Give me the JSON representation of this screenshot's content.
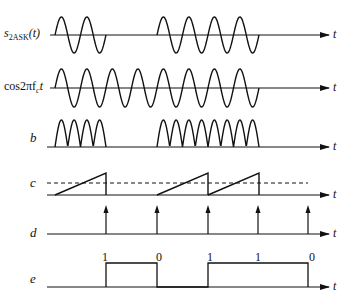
{
  "diagram": {
    "rows": [
      {
        "id": "s2ask",
        "label_main": "s",
        "label_sub": "2ASK",
        "label_tail": "(t)",
        "axis_y": 35,
        "axis_label": "t"
      },
      {
        "id": "carrier",
        "label_main": "cos2πf",
        "label_sub": "c",
        "label_tail": "t",
        "axis_y": 88,
        "axis_label": "t"
      },
      {
        "id": "b",
        "label_main": "b",
        "axis_y": 147,
        "axis_label": "t"
      },
      {
        "id": "c",
        "label_main": "c",
        "axis_y": 195,
        "axis_label": "t"
      },
      {
        "id": "d",
        "label_main": "d",
        "axis_y": 234,
        "axis_label": "t"
      },
      {
        "id": "e",
        "label_main": "e",
        "axis_y": 287,
        "axis_label": "t"
      }
    ],
    "bit_sequence": [
      "1",
      "0",
      "1",
      "1",
      "0"
    ],
    "bit_boundaries_x": [
      55,
      106,
      157,
      208,
      259,
      308
    ],
    "sample_times_x": [
      106,
      157,
      208,
      258,
      308
    ],
    "threshold_line": "dashed",
    "colors": {
      "ink": "#111111",
      "background": "#ffffff"
    }
  }
}
